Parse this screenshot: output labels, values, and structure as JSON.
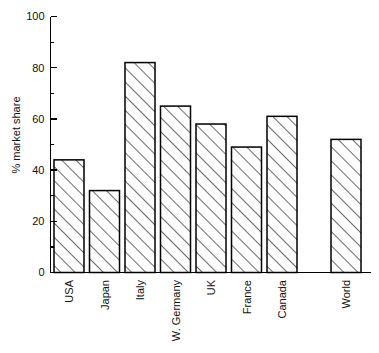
{
  "chart_data": {
    "type": "bar",
    "title": "",
    "xlabel": "",
    "ylabel": "% market share",
    "ylim": [
      0,
      100
    ],
    "yticks": [
      0,
      20,
      40,
      60,
      80,
      100
    ],
    "ytick_labels": [
      "0",
      "20",
      "40",
      "60",
      "80",
      "100"
    ],
    "yminor_ticks": [
      10,
      30,
      50,
      70,
      90
    ],
    "grid": false,
    "legend": false,
    "categories": [
      "USA",
      "Japan",
      "Italy",
      "W. Germany",
      "UK",
      "France",
      "Canada",
      "World"
    ],
    "values": [
      44,
      32,
      82,
      65,
      58,
      49,
      61,
      52
    ],
    "bar_style": {
      "fill": "none",
      "edge_color": "#000000",
      "hatch": "/",
      "hatch_color": "#222222"
    },
    "annotations": [
      "World bar is separated from the country group by a blank gap"
    ]
  },
  "axis": {
    "y_label": "% market share",
    "y_tick_0": "0",
    "y_tick_20": "20",
    "y_tick_40": "40",
    "y_tick_60": "60",
    "y_tick_80": "80",
    "y_tick_100": "100"
  }
}
